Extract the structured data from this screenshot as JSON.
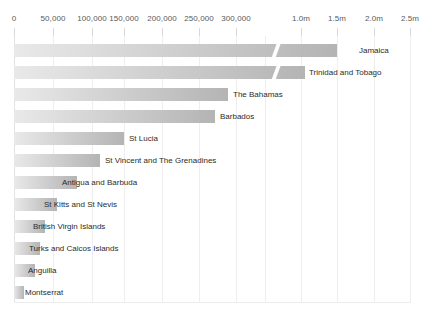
{
  "chart_data": {
    "type": "bar",
    "orientation": "horizontal",
    "title": "",
    "subtitle": "",
    "xlabel": "",
    "ylabel": "",
    "grid": true,
    "legend": "none",
    "axis_break": {
      "present": true,
      "after": 300000,
      "resumes_at": 1000000
    },
    "xlim": [
      0,
      2500000
    ],
    "xtick_labels": [
      "0",
      "50,000",
      "100,000",
      "150,000",
      "200,000",
      "250,000",
      "300,000",
      "1.0m",
      "1.5m",
      "2.0m",
      "2.5m"
    ],
    "xtick_values": [
      0,
      50000,
      100000,
      150000,
      200000,
      250000,
      300000,
      1000000,
      1500000,
      2000000,
      2500000
    ],
    "categories": [
      "Jamaica",
      "Trinidad and Tobago",
      "The Bahamas",
      "Barbados",
      "St Lucia",
      "St Vincent and The Grenadines",
      "Antigua and Barbuda",
      "St Kitts and St Nevis",
      "British Virgin Islands",
      "Turks and Caicos Islands",
      "Anguilla",
      "Montserrat"
    ],
    "values": [
      2150000,
      1700000,
      275000,
      258000,
      142000,
      111000,
      80000,
      55000,
      38000,
      31000,
      25000,
      10000
    ],
    "bar_color_start": "#e9e9e9",
    "bar_color_end": "#b4b4b4"
  },
  "axis": {
    "ticks": [
      {
        "label": "0",
        "x": 14
      },
      {
        "label": "50,000",
        "x": 53
      },
      {
        "label": "100,000",
        "x": 92
      },
      {
        "label": "150,000",
        "x": 124
      },
      {
        "label": "200,000",
        "x": 162
      },
      {
        "label": "250,000",
        "x": 199
      },
      {
        "label": "300,000",
        "x": 236
      },
      {
        "label": "1.0m",
        "x": 301
      },
      {
        "label": "1.5m",
        "x": 337
      },
      {
        "label": "2.0m",
        "x": 374
      },
      {
        "label": "2.5m",
        "x": 410
      }
    ]
  },
  "bars": [
    {
      "label": "Jamaica",
      "y": 8,
      "end": 337,
      "label_x": 359,
      "break_x": 271
    },
    {
      "label": "Trinidad and Tobago",
      "y": 30,
      "end": 305,
      "label_x": 309,
      "break_x": 271
    },
    {
      "label": "The Bahamas",
      "y": 52,
      "end": 228,
      "label_x": 233,
      "break_x": null
    },
    {
      "label": "Barbados",
      "y": 74,
      "end": 215,
      "label_x": 220,
      "break_x": null
    },
    {
      "label": "St Lucia",
      "y": 96,
      "end": 124,
      "label_x": 129,
      "break_x": null
    },
    {
      "label": "St Vincent and The Grenadines",
      "y": 118,
      "end": 100,
      "label_x": 105,
      "break_x": null
    },
    {
      "label": "Antigua and Barbuda",
      "y": 140,
      "end": 77,
      "label_x": 62,
      "break_x": null
    },
    {
      "label": "St Kitts and St Nevis",
      "y": 162,
      "end": 57,
      "label_x": 44,
      "break_x": null
    },
    {
      "label": "British Virgin Islands",
      "y": 184,
      "end": 45,
      "label_x": 33,
      "break_x": null
    },
    {
      "label": "Turks and Caicos Islands",
      "y": 206,
      "end": 40,
      "label_x": 29,
      "break_x": null
    },
    {
      "label": "Anguilla",
      "y": 228,
      "end": 35,
      "label_x": 28,
      "break_x": null
    },
    {
      "label": "Montserrat",
      "y": 250,
      "end": 24,
      "label_x": 25,
      "break_x": null
    }
  ],
  "gridlines": [
    14,
    53,
    92,
    124,
    162,
    199,
    236,
    265,
    301,
    337,
    374,
    410
  ]
}
